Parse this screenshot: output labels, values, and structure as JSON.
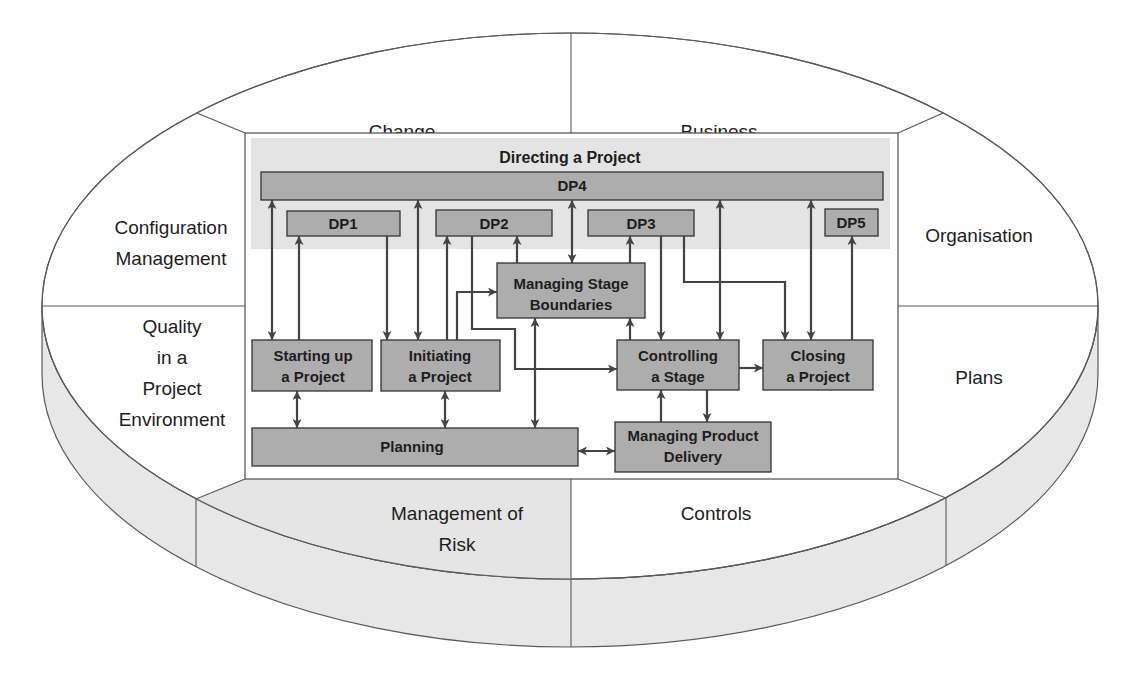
{
  "colors": {
    "box_fill": "#adadad",
    "band_fill": "#e4e4e4",
    "side_fill": "#e7e7e7",
    "risk_fill": "#e5e5e5",
    "line": "#444444",
    "text": "#1e1e1e"
  },
  "components": {
    "change_control": [
      "Change",
      "Control"
    ],
    "business_case": [
      "Business",
      "Case"
    ],
    "organisation": [
      "Organisation"
    ],
    "plans": [
      "Plans"
    ],
    "controls": [
      "Controls"
    ],
    "management_of_risk": [
      "Management of",
      "Risk"
    ],
    "quality": [
      "Quality",
      "in a",
      "Project",
      "Environment"
    ],
    "configuration_management": [
      "Configuration",
      "Management"
    ]
  },
  "directing": {
    "title": "Directing a Project",
    "dp1": "DP1",
    "dp2": "DP2",
    "dp3": "DP3",
    "dp4": "DP4",
    "dp5": "DP5"
  },
  "processes": {
    "starting_up": [
      "Starting up",
      "a Project"
    ],
    "initiating": [
      "Initiating",
      "a Project"
    ],
    "managing_stage_boundaries": [
      "Managing Stage",
      "Boundaries"
    ],
    "controlling_stage": [
      "Controlling",
      "a Stage"
    ],
    "closing": [
      "Closing",
      "a Project"
    ],
    "planning": [
      "Planning"
    ],
    "managing_product_delivery": [
      "Managing Product",
      "Delivery"
    ]
  }
}
